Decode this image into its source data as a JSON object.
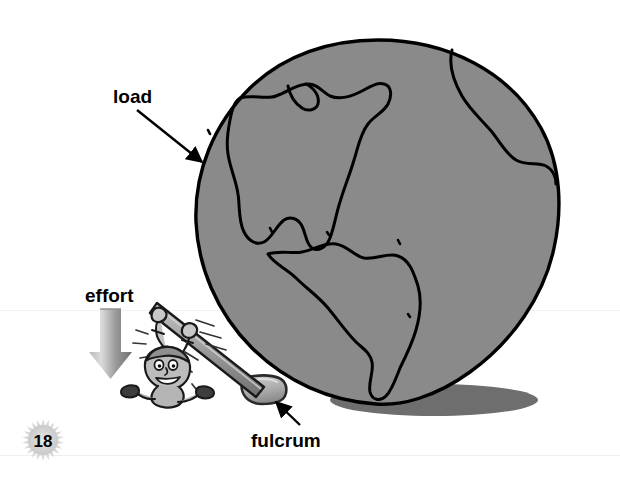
{
  "page": {
    "number": "18",
    "width": 620,
    "height": 481,
    "background_color": "#ffffff",
    "footer_rule_color": "#efefef"
  },
  "illustration": {
    "title_alt": "Lever diagram: a person using a lever to lift the Earth",
    "colors": {
      "globe_fill": "#8a8a8a",
      "globe_outline": "#000000",
      "shadow": "#6e6e6e",
      "lever_fill": "#9a9a9a",
      "lever_outline": "#1a1a1a",
      "fulcrum_fill": "#b4b4b4",
      "fulcrum_outline": "#2a2a2a",
      "effort_arrow_light": "#d2d2d2",
      "effort_arrow_dark": "#6f6f6f",
      "figure_fill": "#b8b8b8",
      "figure_outline": "#1a1a1a",
      "label_color": "#000000",
      "pointer_color": "#000000"
    },
    "globe": {
      "name": "earth-globe",
      "center_x": 378,
      "center_y": 222,
      "radius": 182,
      "continents": "North and South America"
    },
    "shadow": {
      "name": "globe-shadow",
      "center_x": 434,
      "center_y": 400,
      "rx": 104,
      "ry": 16
    },
    "fulcrum": {
      "name": "fulcrum-rock",
      "x": 238,
      "y": 378,
      "width": 48,
      "height": 27
    },
    "lever": {
      "name": "lever-bar",
      "x1": 158,
      "y1": 308,
      "x2": 262,
      "y2": 390
    },
    "figure": {
      "name": "cartoon-person",
      "x": 138,
      "y": 308,
      "width": 86,
      "height": 92
    }
  },
  "labels": {
    "load": {
      "text": "load",
      "text_x": 113,
      "text_y": 103,
      "font_size": 19,
      "pointer_from_x": 137,
      "pointer_from_y": 110,
      "pointer_to_x": 202,
      "pointer_to_y": 162
    },
    "effort": {
      "text": "effort",
      "text_x": 85,
      "text_y": 302,
      "font_size": 19,
      "arrow_x": 110,
      "arrow_top_y": 308,
      "arrow_bottom_y": 378
    },
    "fulcrum": {
      "text": "fulcrum",
      "text_x": 251,
      "text_y": 447,
      "font_size": 19,
      "pointer_from_x": 300,
      "pointer_from_y": 425,
      "pointer_to_x": 275,
      "pointer_to_y": 402
    }
  },
  "page_badge": {
    "name": "page-number-badge",
    "center_x": 43,
    "center_y": 440,
    "radius": 15,
    "spike_radius": 21,
    "spikes": 22,
    "fill": "#d9d9d9",
    "text": "18",
    "font_size": 17
  }
}
